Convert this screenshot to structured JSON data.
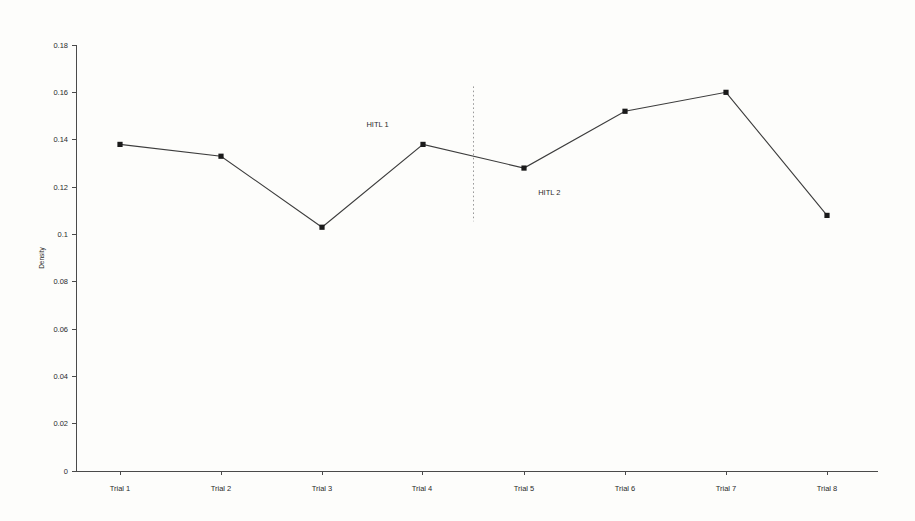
{
  "chart_data": {
    "type": "line",
    "title": "",
    "subtitle": "",
    "xlabel": "",
    "ylabel": "Density",
    "categories": [
      "Trial 1",
      "Trial 2",
      "Trial 3",
      "Trial 4",
      "Trial 5",
      "Trial 6",
      "Trial 7",
      "Trial 8"
    ],
    "values": [
      0.138,
      0.133,
      0.103,
      0.138,
      0.128,
      0.152,
      0.16,
      0.108
    ],
    "series": [
      {
        "name": "Density",
        "values": [
          0.138,
          0.133,
          0.103,
          0.138,
          0.128,
          0.152,
          0.16,
          0.108
        ]
      }
    ],
    "ylim": [
      0,
      0.18
    ],
    "ytick_values": [
      0,
      0.02,
      0.04,
      0.06,
      0.08,
      0.1,
      0.12,
      0.14,
      0.16,
      0.18
    ],
    "ytick_labels": [
      "0",
      "0.02",
      "0.04",
      "0.06",
      "0.08",
      "0.1",
      "0.12",
      "0.14",
      "0.16",
      "0.18"
    ],
    "grid": false,
    "legend": "none",
    "marker": "square",
    "line_color": "#3c3c3c",
    "marker_color": "#1a1a1a",
    "background_color": "#fdfdfb",
    "annotations": [
      {
        "id": "hitl-1",
        "text": "HITL 1",
        "x_value": 3.55,
        "y_value": 0.1455,
        "position": "above-left-of-divider"
      },
      {
        "id": "hitl-2",
        "text": "HITL 2",
        "x_value": 5.25,
        "y_value": 0.1165,
        "position": "below-right-of-divider"
      }
    ],
    "reference_lines": [
      {
        "id": "phase-divider",
        "orientation": "vertical",
        "x_value": 4.5,
        "style": "dotted",
        "color": "#9a9a9a",
        "y_from": 0.1055,
        "y_to": 0.1625
      }
    ]
  }
}
